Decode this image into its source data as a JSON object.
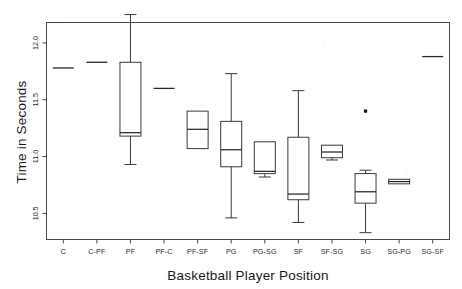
{
  "chart_data": {
    "type": "box",
    "title": "",
    "xlabel": "Basketball Player Position",
    "ylabel": "Time in Seconds",
    "ylim": [
      10.27,
      12.18
    ],
    "yticks": [
      10.5,
      11.0,
      11.5,
      12.0
    ],
    "ytick_labels": [
      "10.5",
      "11.0",
      "11.5",
      "12.0"
    ],
    "grid": false,
    "legend": null,
    "categories": [
      "C",
      "C-PF",
      "PF",
      "PF-C",
      "PF-SF",
      "PG",
      "PG-SG",
      "SF",
      "SF-SG",
      "SG",
      "SG-PG",
      "SG-SF"
    ],
    "boxes": [
      {
        "category": "C",
        "min": 11.78,
        "q1": 11.78,
        "median": 11.78,
        "q3": 11.78,
        "max": 11.78,
        "outliers": [],
        "degenerate": true
      },
      {
        "category": "C-PF",
        "min": 11.83,
        "q1": 11.83,
        "median": 11.83,
        "q3": 11.83,
        "max": 11.83,
        "outliers": [],
        "degenerate": true
      },
      {
        "category": "PF",
        "min": 10.93,
        "q1": 11.18,
        "median": 11.21,
        "q3": 11.83,
        "max": 12.25,
        "outliers": [],
        "degenerate": false
      },
      {
        "category": "PF-C",
        "min": 11.6,
        "q1": 11.6,
        "median": 11.6,
        "q3": 11.6,
        "max": 11.6,
        "outliers": [],
        "degenerate": true
      },
      {
        "category": "PF-SF",
        "min": 11.07,
        "q1": 11.07,
        "median": 11.24,
        "q3": 11.4,
        "max": 11.4,
        "outliers": [],
        "degenerate": false
      },
      {
        "category": "PG",
        "min": 10.46,
        "q1": 10.91,
        "median": 11.06,
        "q3": 11.31,
        "max": 11.73,
        "outliers": [],
        "degenerate": false
      },
      {
        "category": "PG-SG",
        "min": 10.82,
        "q1": 10.85,
        "median": 10.87,
        "q3": 11.13,
        "max": 11.13,
        "outliers": [],
        "degenerate": false
      },
      {
        "category": "SF",
        "min": 10.42,
        "q1": 10.62,
        "median": 10.67,
        "q3": 11.17,
        "max": 11.58,
        "outliers": [],
        "degenerate": false
      },
      {
        "category": "SF-SG",
        "min": 10.97,
        "q1": 10.99,
        "median": 11.04,
        "q3": 11.1,
        "max": 11.1,
        "outliers": [],
        "degenerate": false
      },
      {
        "category": "SG",
        "min": 10.33,
        "q1": 10.59,
        "median": 10.69,
        "q3": 10.85,
        "max": 10.88,
        "outliers": [
          11.4
        ],
        "degenerate": false
      },
      {
        "category": "SG-PG",
        "min": 10.76,
        "q1": 10.76,
        "median": 10.78,
        "q3": 10.8,
        "max": 10.8,
        "outliers": [],
        "degenerate": false
      },
      {
        "category": "SG-SF",
        "min": 11.88,
        "q1": 11.88,
        "median": 11.88,
        "q3": 11.88,
        "max": 11.88,
        "outliers": [],
        "degenerate": true
      }
    ]
  },
  "axes": {
    "y_title": "Time in Seconds",
    "x_title": "Basketball Player Position"
  }
}
